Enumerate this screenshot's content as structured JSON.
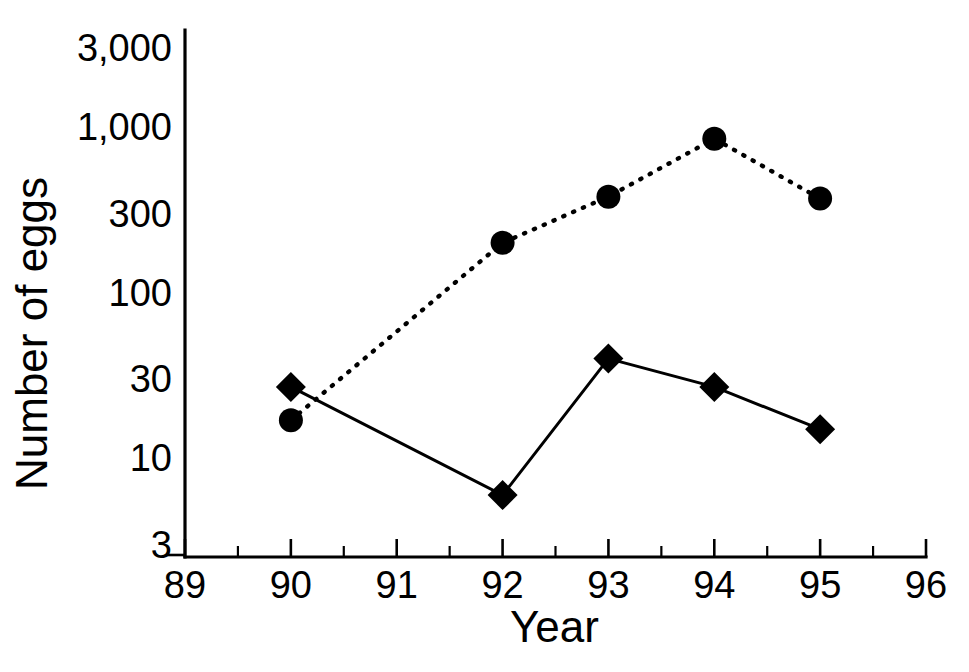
{
  "chart_data": {
    "type": "line",
    "title": "",
    "xlabel": "Year",
    "ylabel": "Number of eggs",
    "yscale": "log",
    "ylim": [
      3,
      3000
    ],
    "xlim": [
      89,
      96
    ],
    "grid": false,
    "legend": "none",
    "ytick_labels": [
      "3,000",
      "1,000",
      "300",
      "100",
      "30",
      "10",
      "3"
    ],
    "ytick_values": [
      3000,
      1000,
      300,
      100,
      30,
      10,
      3
    ],
    "xtick_labels": [
      "89",
      "90",
      "91",
      "92",
      "93",
      "94",
      "95",
      "96"
    ],
    "xtick_values": [
      89,
      90,
      91,
      92,
      93,
      94,
      95,
      96
    ],
    "x_minor_ticks": [
      89.5,
      90.5,
      91.5,
      92.5,
      93.5,
      94.5,
      95.5
    ],
    "series": [
      {
        "name": "dotted-circle-series",
        "marker": "circle",
        "linestyle": "dotted",
        "x": [
          90,
          92,
          93,
          94,
          95
        ],
        "values": [
          17,
          200,
          380,
          850,
          370
        ]
      },
      {
        "name": "solid-diamond-series",
        "marker": "diamond",
        "linestyle": "solid",
        "x": [
          90,
          92,
          93,
          94,
          95
        ],
        "values": [
          27,
          6,
          40,
          27,
          15
        ]
      }
    ]
  },
  "axes": {
    "y_title": "Number of eggs",
    "x_title": "Year",
    "y_ticks": [
      {
        "label": "3,000"
      },
      {
        "label": "1,000"
      },
      {
        "label": "300"
      },
      {
        "label": "100"
      },
      {
        "label": "30"
      },
      {
        "label": "10"
      },
      {
        "label": "3"
      }
    ],
    "x_ticks": [
      {
        "label": "89"
      },
      {
        "label": "90"
      },
      {
        "label": "91"
      },
      {
        "label": "92"
      },
      {
        "label": "93"
      },
      {
        "label": "94"
      },
      {
        "label": "95"
      },
      {
        "label": "96"
      }
    ]
  },
  "style": {
    "ink": "#000000",
    "background": "#ffffff"
  }
}
